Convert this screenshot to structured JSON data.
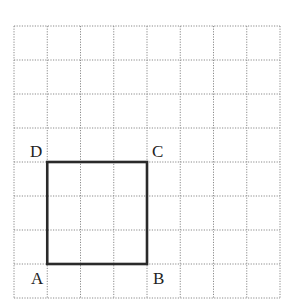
{
  "diagram": {
    "grid": {
      "cols": 8,
      "rows": 8,
      "left": 14,
      "top": 26,
      "cell_w": 33.25,
      "cell_h": 34,
      "line_color": "#8a8a8a"
    },
    "square": {
      "from_col": 1,
      "from_row": 4,
      "to_col": 4,
      "to_row": 7,
      "stroke": "#2a2a2a"
    },
    "labels": {
      "A": "A",
      "B": "B",
      "C": "C",
      "D": "D"
    }
  }
}
